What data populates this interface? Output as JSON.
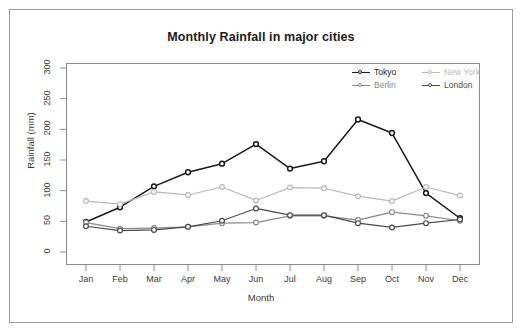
{
  "figure": {
    "title": "Monthly Rainfall in major cities",
    "background_color": "#ffffff",
    "border_color": "#9a9a9a",
    "panel_border_color": "#8c8c8c"
  },
  "axes": {
    "x_label": "Month",
    "y_label": "Rainfall (mm)",
    "y_ticks": [
      "0",
      "50",
      "100",
      "150",
      "200",
      "250",
      "300"
    ],
    "x_ticks": [
      "Jan",
      "Feb",
      "Mar",
      "Apr",
      "May",
      "Jun",
      "Jul",
      "Aug",
      "Sep",
      "Oct",
      "Nov",
      "Dec"
    ]
  },
  "legend": {
    "entries": [
      {
        "label": "Tokyo",
        "color": "#1a1a1a"
      },
      {
        "label": "New York",
        "color": "#b9b9b9"
      },
      {
        "label": "Berlin",
        "color": "#8a8a8a"
      },
      {
        "label": "London",
        "color": "#4a4a4a"
      }
    ]
  },
  "chart_data": {
    "type": "line",
    "title": "Monthly Rainfall in major cities",
    "xlabel": "Month",
    "ylabel": "Rainfall (mm)",
    "categories": [
      "Jan",
      "Feb",
      "Mar",
      "Apr",
      "May",
      "Jun",
      "Jul",
      "Aug",
      "Sep",
      "Oct",
      "Nov",
      "Dec"
    ],
    "ylim": [
      0,
      300
    ],
    "yticks": [
      0,
      50,
      100,
      150,
      200,
      250,
      300
    ],
    "grid": false,
    "legend_position": "top-right",
    "marker": "circle",
    "series": [
      {
        "name": "Tokyo",
        "color": "#1a1a1a",
        "values": [
          49,
          73,
          107,
          130,
          144,
          176,
          136,
          148,
          216,
          194,
          96,
          55
        ]
      },
      {
        "name": "New York",
        "color": "#b9b9b9",
        "values": [
          83,
          78,
          98,
          93,
          106,
          84,
          105,
          104,
          91,
          83,
          106,
          92
        ]
      },
      {
        "name": "Berlin",
        "color": "#8a8a8a",
        "values": [
          48,
          38,
          39,
          41,
          47,
          48,
          59,
          59,
          52,
          65,
          59,
          51
        ]
      },
      {
        "name": "London",
        "color": "#4a4a4a",
        "values": [
          42,
          35,
          36,
          41,
          51,
          71,
          60,
          60,
          47,
          40,
          47,
          53
        ]
      }
    ]
  }
}
